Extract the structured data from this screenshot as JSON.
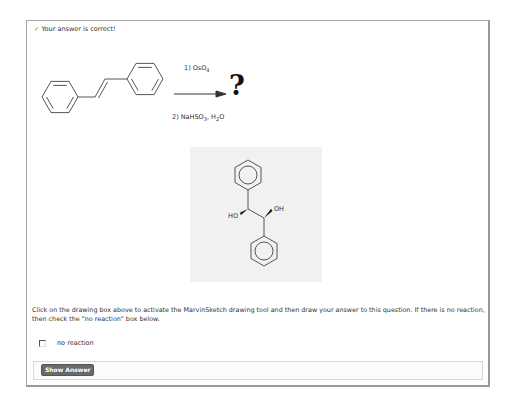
{
  "feedback": {
    "icon": "check-icon",
    "icon_glyph": "✓",
    "text": "Your answer is correct!"
  },
  "reaction": {
    "reactant": "trans-stilbene",
    "reagent1_prefix": "1) OsO",
    "reagent1_sub": "4",
    "reagent2_prefix": "2) NaHSO",
    "reagent2_sub1": "3",
    "reagent2_mid": ", H",
    "reagent2_sub2": "2",
    "reagent2_suffix": "O",
    "product_placeholder": "?"
  },
  "answer_drawing": {
    "label_ho": "HO",
    "label_oh": "OH",
    "background": "#f1f1f1"
  },
  "instructions": "Click on the drawing box above to activate the MarvinSketch drawing tool and then draw your answer to this question. If there is no reaction, then check the \"no reaction\" box below.",
  "no_reaction": {
    "label": "no reaction",
    "checked": false
  },
  "show_answer": {
    "label": "Show Answer"
  },
  "colors": {
    "button_bg": "#6a6a6a",
    "border": "#a8a8a8"
  }
}
